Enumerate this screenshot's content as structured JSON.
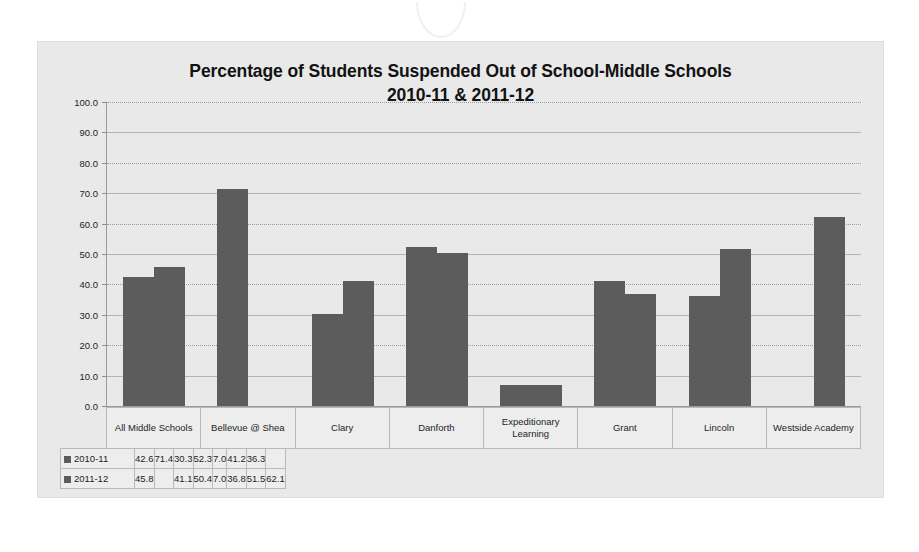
{
  "chart_data": {
    "type": "bar",
    "title": "Percentage of Students Suspended Out of School-Middle Schools",
    "subtitle": "2010-11 & 2011-12",
    "xlabel": "",
    "ylabel": "",
    "ylim": [
      0,
      100
    ],
    "ytick_step": 10,
    "ytick_labels": [
      "100.0",
      "90.0",
      "80.0",
      "70.0",
      "60.0",
      "50.0",
      "40.0",
      "30.0",
      "20.0",
      "10.0",
      "0.0"
    ],
    "grid": true,
    "legend_position": "table-left",
    "bar_color": "#5c5c5c",
    "categories": [
      "All Middle Schools",
      "Bellevue @ Shea",
      "Clary",
      "Danforth",
      "Expeditionary Learning",
      "Grant",
      "Lincoln",
      "Westside Academy"
    ],
    "series": [
      {
        "name": "2010-11",
        "values": [
          42.6,
          71.4,
          30.3,
          52.3,
          7.0,
          41.2,
          36.3,
          null
        ],
        "labels": [
          "42.6",
          "71.4",
          "30.3",
          "52.3",
          "7.0",
          "41.2",
          "36.3",
          ""
        ]
      },
      {
        "name": "2011-12",
        "values": [
          45.8,
          null,
          41.1,
          50.4,
          7.0,
          36.8,
          51.5,
          62.1
        ],
        "labels": [
          "45.8",
          "",
          "41.1",
          "50.4",
          "7.0",
          "36.8",
          "51.5",
          "62.1"
        ]
      }
    ]
  },
  "icons": {
    "legend_key": "legend-square-icon",
    "scan_artifact": "scan-seal-artifact"
  }
}
